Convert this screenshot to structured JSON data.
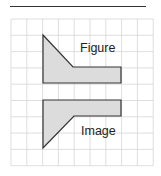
{
  "diagram": {
    "top_rule": {
      "x1": 10,
      "y1": 6.5,
      "x2": 146,
      "y2": 6.5,
      "color": "#333333"
    },
    "grid": {
      "x0": 11,
      "y0": 19,
      "cols": 9,
      "rows": 9,
      "cell_w": 15.8,
      "cell_h": 16.3,
      "color": "#d6d6d6"
    },
    "shapes": [
      {
        "name": "figure-shape",
        "label": "Figure",
        "fill": "#dcdcdc",
        "stroke": "#333333",
        "points": "43,35 73,67 121,67 121,83 43,83",
        "label_x": 80,
        "label_y": 52
      },
      {
        "name": "image-shape",
        "label": "Image",
        "fill": "#dcdcdc",
        "stroke": "#333333",
        "points": "43,100 121,100 121,116 74,116 43,148",
        "label_x": 81,
        "label_y": 135
      }
    ]
  }
}
